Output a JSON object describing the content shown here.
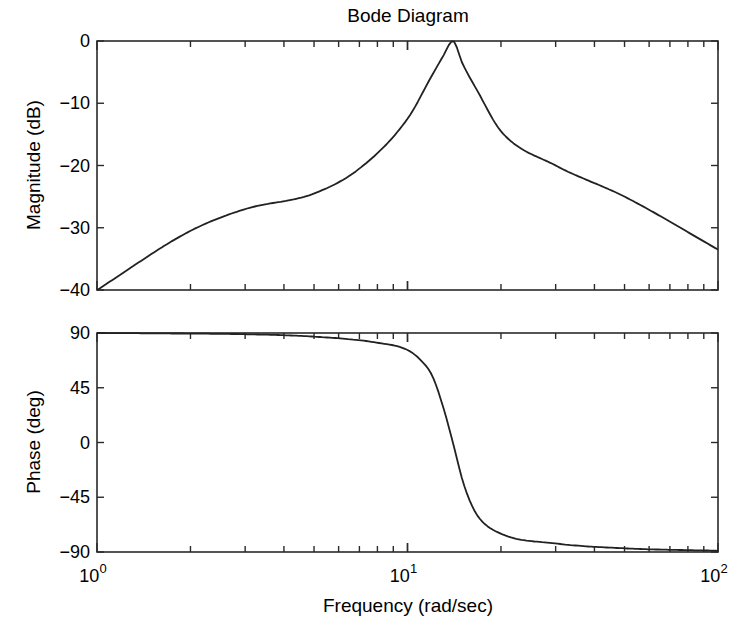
{
  "chart_data": [
    {
      "type": "line",
      "panel": "magnitude",
      "title": "Bode Diagram",
      "xlabel": "",
      "ylabel": "Magnitude (dB)",
      "xscale": "log",
      "xlim": [
        1,
        100
      ],
      "ylim": [
        -40,
        0
      ],
      "yticks": [
        0,
        -10,
        -20,
        -30,
        -40
      ],
      "ytick_labels": [
        "0",
        "−10",
        "−20",
        "−30",
        "−40"
      ],
      "grid": false,
      "legend": null,
      "series": [
        {
          "name": "Magnitude",
          "x": [
            1,
            2,
            3,
            5,
            7,
            10,
            12,
            13,
            14,
            15,
            17,
            20,
            30,
            50,
            100
          ],
          "y": [
            -40,
            -30.5,
            -27,
            -24.5,
            -20.5,
            -12.5,
            -5.5,
            -2.5,
            0,
            -3.5,
            -8.5,
            -14.5,
            -20,
            -25,
            -33.5
          ]
        }
      ]
    },
    {
      "type": "line",
      "panel": "phase",
      "xlabel": "Frequency (rad/sec)",
      "ylabel": "Phase (deg)",
      "xscale": "log",
      "xlim": [
        1,
        100
      ],
      "ylim": [
        -90,
        90
      ],
      "xticks": [
        1,
        10,
        100
      ],
      "xtick_labels": [
        "10",
        "10",
        "10"
      ],
      "xtick_exponents": [
        "0",
        "1",
        "2"
      ],
      "yticks": [
        90,
        45,
        0,
        -45,
        -90
      ],
      "ytick_labels": [
        "90",
        "45",
        "0",
        "−45",
        "−90"
      ],
      "grid": false,
      "legend": null,
      "series": [
        {
          "name": "Phase",
          "x": [
            1,
            2,
            3,
            5,
            8,
            10,
            11,
            12,
            13,
            14,
            15,
            16,
            17,
            20,
            30,
            50,
            100
          ],
          "y": [
            90,
            89.5,
            89,
            87,
            82,
            76,
            68,
            55,
            30,
            0,
            -30,
            -50,
            -62,
            -75,
            -83,
            -87,
            -89
          ]
        }
      ]
    }
  ],
  "labels": {
    "title": "Bode Diagram",
    "mag_ylabel": "Magnitude (dB)",
    "phase_ylabel": "Phase (deg)",
    "xlabel": "Frequency (rad/sec)"
  },
  "colors": {
    "line": "#222222",
    "frame": "#2a2a2a",
    "background": "#ffffff"
  }
}
